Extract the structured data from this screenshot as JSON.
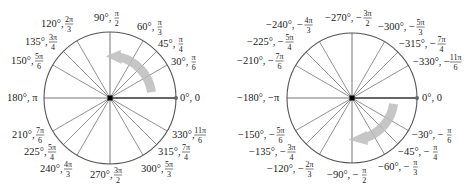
{
  "diagrams": [
    {
      "name": "positive-angles-circle",
      "center": [
        110,
        98
      ],
      "radius": 66,
      "arrow_direction": "counterclockwise",
      "labels": [
        {
          "deg": "0°, ",
          "rad": "0",
          "frac": false,
          "x": 180,
          "y": 101,
          "anchor": "start"
        },
        {
          "deg": "30°, ",
          "rad_num": "π",
          "rad_den": "6",
          "frac": true,
          "x": 171,
          "y": 65,
          "anchor": "start"
        },
        {
          "deg": "45°, ",
          "rad_num": "π",
          "rad_den": "4",
          "frac": true,
          "x": 158,
          "y": 47,
          "anchor": "start"
        },
        {
          "deg": "60°, ",
          "rad_num": "π",
          "rad_den": "3",
          "frac": true,
          "x": 137,
          "y": 30,
          "anchor": "start"
        },
        {
          "deg": "90°, ",
          "rad_num": "π",
          "rad_den": "2",
          "frac": true,
          "x": 94,
          "y": 21,
          "anchor": "start"
        },
        {
          "deg": "120°, ",
          "rad_num": "2π",
          "rad_den": "3",
          "frac": true,
          "x": 41,
          "y": 27,
          "anchor": "start"
        },
        {
          "deg": "135°, ",
          "rad_num": "3π",
          "rad_den": "4",
          "frac": true,
          "x": 25,
          "y": 45,
          "anchor": "start"
        },
        {
          "deg": "150°, ",
          "rad_num": "5π",
          "rad_den": "6",
          "frac": true,
          "x": 11,
          "y": 64,
          "anchor": "start"
        },
        {
          "deg": "180°, π",
          "frac": false,
          "x": 7,
          "y": 101,
          "anchor": "start"
        },
        {
          "deg": "210°, ",
          "rad_num": "7π",
          "rad_den": "6",
          "frac": true,
          "x": 12,
          "y": 138,
          "anchor": "start"
        },
        {
          "deg": "225°, ",
          "rad_num": "5π",
          "rad_den": "4",
          "frac": true,
          "x": 24,
          "y": 155,
          "anchor": "start"
        },
        {
          "deg": "240°, ",
          "rad_num": "4π",
          "rad_den": "3",
          "frac": true,
          "x": 40,
          "y": 172,
          "anchor": "start"
        },
        {
          "deg": "270°, ",
          "rad_num": "3π",
          "rad_den": "2",
          "frac": true,
          "x": 90,
          "y": 178,
          "anchor": "start"
        },
        {
          "deg": "300°, ",
          "rad_num": "5π",
          "rad_den": "3",
          "frac": true,
          "x": 141,
          "y": 172,
          "anchor": "start"
        },
        {
          "deg": "315°, ",
          "rad_num": "7π",
          "rad_den": "4",
          "frac": true,
          "x": 158,
          "y": 155,
          "anchor": "start"
        },
        {
          "deg": "330°, ",
          "rad_num": "11π",
          "rad_den": "6",
          "frac": true,
          "x": 172,
          "y": 138,
          "anchor": "start"
        }
      ]
    },
    {
      "name": "negative-angles-circle",
      "center": [
        352,
        98
      ],
      "radius": 65,
      "arrow_direction": "clockwise",
      "labels": [
        {
          "deg": "0°, ",
          "rad": "0",
          "frac": false,
          "x": 422,
          "y": 101,
          "anchor": "start"
        },
        {
          "deg": "−30°, −",
          "rad_num": "π",
          "rad_den": "6",
          "frac": true,
          "x": 412,
          "y": 138,
          "anchor": "start"
        },
        {
          "deg": "−45°, −",
          "rad_num": "π",
          "rad_den": "4",
          "frac": true,
          "x": 398,
          "y": 155,
          "anchor": "start"
        },
        {
          "deg": "−60°, −",
          "rad_num": "π",
          "rad_den": "3",
          "frac": true,
          "x": 378,
          "y": 170,
          "anchor": "start"
        },
        {
          "deg": "−90°, −",
          "rad_num": "π",
          "rad_den": "2",
          "frac": true,
          "x": 327,
          "y": 178,
          "anchor": "start"
        },
        {
          "deg": "−120°, −",
          "rad_num": "2π",
          "rad_den": "3",
          "frac": true,
          "x": 267,
          "y": 172,
          "anchor": "start"
        },
        {
          "deg": "−135°, −",
          "rad_num": "3π",
          "rad_den": "4",
          "frac": true,
          "x": 249,
          "y": 155,
          "anchor": "start"
        },
        {
          "deg": "−150°, −",
          "rad_num": "5π",
          "rad_den": "6",
          "frac": true,
          "x": 238,
          "y": 138,
          "anchor": "start"
        },
        {
          "deg": "−180°, −π",
          "frac": false,
          "x": 237,
          "y": 101,
          "anchor": "start"
        },
        {
          "deg": "−210°, −",
          "rad_num": "7π",
          "rad_den": "6",
          "frac": true,
          "x": 237,
          "y": 64,
          "anchor": "start"
        },
        {
          "deg": "−225°, −",
          "rad_num": "5π",
          "rad_den": "4",
          "frac": true,
          "x": 247,
          "y": 45,
          "anchor": "start"
        },
        {
          "deg": "−240°, −",
          "rad_num": "4π",
          "rad_den": "3",
          "frac": true,
          "x": 266,
          "y": 28,
          "anchor": "start"
        },
        {
          "deg": "−270°, −",
          "rad_num": "3π",
          "rad_den": "2",
          "frac": true,
          "x": 325,
          "y": 21,
          "anchor": "start"
        },
        {
          "deg": "−300°, −",
          "rad_num": "5π",
          "rad_den": "3",
          "frac": true,
          "x": 378,
          "y": 30,
          "anchor": "start"
        },
        {
          "deg": "−315°, −",
          "rad_num": "7π",
          "rad_den": "4",
          "frac": true,
          "x": 399,
          "y": 47,
          "anchor": "start"
        },
        {
          "deg": "−330°, −",
          "rad_num": "11π",
          "rad_den": "6",
          "frac": true,
          "x": 413,
          "y": 65,
          "anchor": "start"
        }
      ]
    }
  ],
  "angles_deg": [
    0,
    30,
    45,
    60,
    90,
    120,
    135,
    150,
    180,
    210,
    225,
    240,
    270,
    300,
    315,
    330
  ],
  "colors": {
    "circle": "#555555",
    "spoke": "#777777",
    "initial_side": "#666666",
    "center_dot": "#000000",
    "arrow": "#bdbdbd"
  }
}
